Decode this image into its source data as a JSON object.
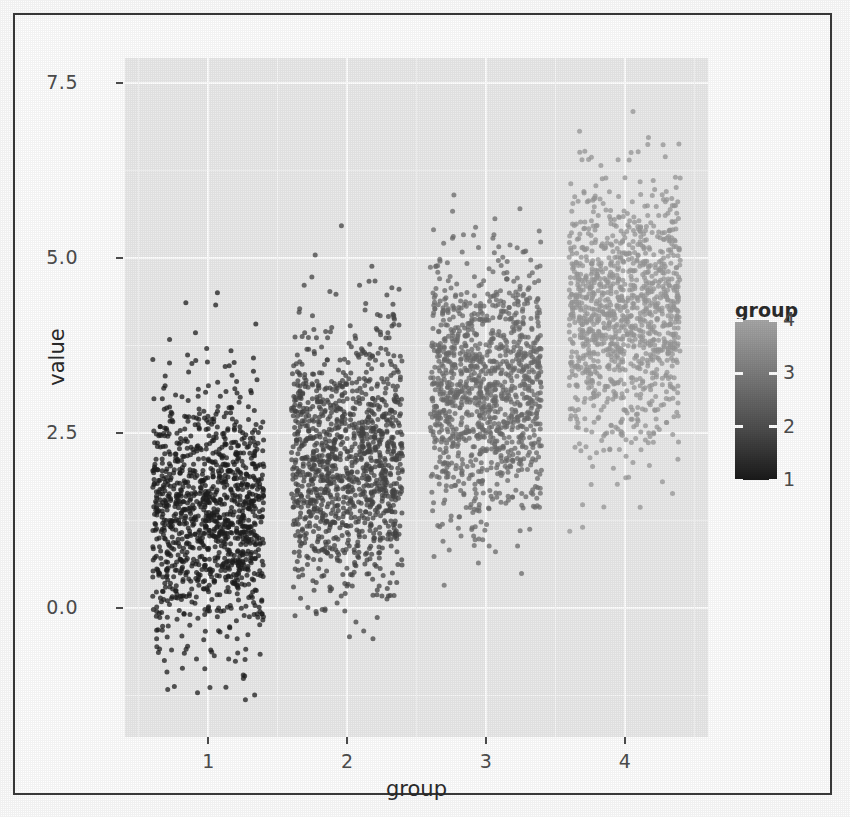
{
  "chart_data": {
    "type": "scatter",
    "plot_style": "jitter-strip-plot",
    "title": "",
    "xlabel": "group",
    "ylabel": "value",
    "xlim": [
      0.4,
      4.6
    ],
    "ylim": [
      -1.85,
      7.85
    ],
    "x_tick_labels": [
      "1",
      "2",
      "3",
      "4"
    ],
    "x_tick_values": [
      1,
      2,
      3,
      4
    ],
    "y_tick_labels": [
      "0.0",
      "2.5",
      "5.0",
      "7.5"
    ],
    "y_tick_values": [
      0.0,
      2.5,
      5.0,
      7.5
    ],
    "grid": true,
    "grid_color": "#ffffff",
    "panel_background": "#ebebeb",
    "categories": [
      "1",
      "2",
      "3",
      "4"
    ],
    "series": [
      {
        "name": "1",
        "group": 1,
        "color": "#1f1f1f",
        "n": 1200,
        "mean": 1.3,
        "sd": 0.92,
        "min": -1.6,
        "max": 4.6,
        "jitter_width": 0.4
      },
      {
        "name": "2",
        "group": 2,
        "color": "#454545",
        "n": 1200,
        "mean": 2.1,
        "sd": 0.92,
        "min": -0.75,
        "max": 5.65,
        "jitter_width": 0.4
      },
      {
        "name": "3",
        "group": 3,
        "color": "#6e6e6e",
        "n": 1200,
        "mean": 3.1,
        "sd": 0.92,
        "min": -0.05,
        "max": 6.0,
        "jitter_width": 0.4
      },
      {
        "name": "4",
        "group": 4,
        "color": "#9a9a9a",
        "n": 1200,
        "mean": 4.2,
        "sd": 0.92,
        "min": 0.95,
        "max": 7.35,
        "jitter_width": 0.4
      }
    ],
    "legend": {
      "title": "group",
      "position": "right",
      "type": "continuous-colorbar",
      "tick_labels": [
        "4",
        "3",
        "2",
        "1"
      ],
      "tick_values": [
        4,
        3,
        2,
        1
      ],
      "gradient_top": "#a8a8a8",
      "gradient_bottom": "#1a1a1a"
    }
  },
  "axes": {
    "y_label": "value",
    "x_label": "group",
    "y_ticks": [
      "7.5",
      "5.0",
      "2.5",
      "0.0"
    ],
    "x_ticks": [
      "1",
      "2",
      "3",
      "4"
    ]
  },
  "legend": {
    "title": "group",
    "labels": [
      "4",
      "3",
      "2",
      "1"
    ]
  },
  "colors": {
    "panel_bg": "#ebebeb",
    "grid": "#ffffff",
    "axis_text": "#4d4d4d",
    "label_text": "#2b2b2b",
    "frame": "#3a3a3a"
  }
}
